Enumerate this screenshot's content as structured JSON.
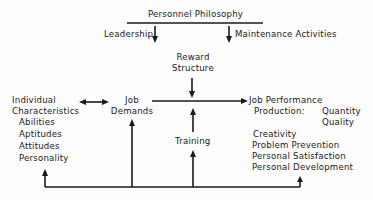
{
  "diagram": {
    "title": "Personnel Philosophy",
    "leadership": "Leadership",
    "maintenance": "Maintenance Activities",
    "reward": [
      "Reward",
      "Structure"
    ],
    "individual": {
      "heading": [
        "Individual",
        "Characteristics"
      ],
      "items": [
        "Abilities",
        "Aptitudes",
        "Attitudes",
        "Personality"
      ]
    },
    "job_demands": [
      "Job",
      "Demands"
    ],
    "training": "Training",
    "job_performance": {
      "heading": "Job Performance",
      "production_label": "Production:",
      "production_items": [
        "Quantity",
        "Quality"
      ],
      "items": [
        "Creativity",
        "Problem Prevention",
        "Personal Satisfaction",
        "Personal Development"
      ]
    }
  },
  "colors": {
    "ink": "#1a1a1a",
    "background": "#fdfdfd"
  }
}
